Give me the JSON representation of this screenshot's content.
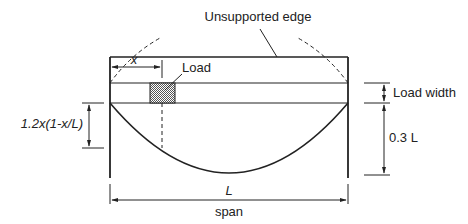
{
  "diagram": {
    "labels": {
      "unsupported_edge": "Unsupported edge",
      "x": "x",
      "load": "Load",
      "load_width": "Load width",
      "deflection_formula": "1.2x(1-x/L)",
      "depth": "0.3 L",
      "L": "L",
      "span": "span"
    },
    "colors": {
      "line": "#222222",
      "hatch": "#555555",
      "background": "#ffffff"
    }
  }
}
